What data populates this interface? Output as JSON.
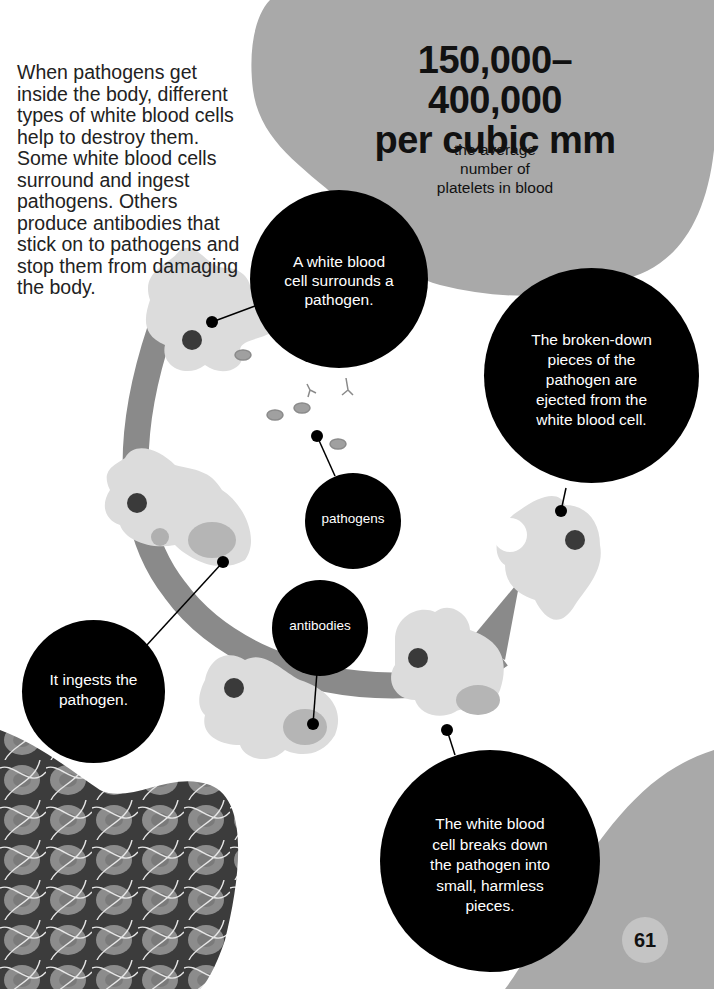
{
  "intro_text": "When pathogens get inside the body, different types of white blood cells help to destroy them. Some white blood cells surround and ingest pathogens. Others produce antibodies that stick on to pathogens and stop them from damaging the body.",
  "stat": {
    "value_line1": "150,000–400,000",
    "value_line2": "per cubic mm",
    "caption_line1": "the average",
    "caption_line2": "number of",
    "caption_line3": "platelets in blood"
  },
  "diagram": {
    "step1": [
      "A white blood",
      "cell surrounds a",
      "pathogen."
    ],
    "step2": [
      "It ingests the",
      "pathogen."
    ],
    "step3": [
      "The white blood",
      "cell breaks down",
      "the pathogen into",
      "small, harmless",
      "pieces."
    ],
    "step4": [
      "The broken-down",
      "pieces of the",
      "pathogen are",
      "ejected from the",
      "white blood cell."
    ],
    "label_pathogens": "pathogens",
    "label_antibodies": "antibodies"
  },
  "colors": {
    "blob_grey": "#a9a9a9",
    "cell_light": "#dcdcdc",
    "arrow_band": "#8a8a8a",
    "nucleus": "#3a3a3a",
    "bubble": "#000000"
  },
  "page_number": "61"
}
